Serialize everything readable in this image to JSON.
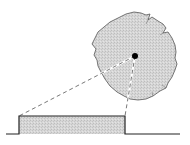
{
  "diagram": {
    "colors": {
      "background": "#ffffff",
      "fill": "#d4d4d4",
      "stroke": "#333333",
      "dot": "#000000",
      "dash": "#555555"
    },
    "blob": {
      "cx": 135,
      "cy": 58,
      "r": 42
    },
    "center_dot": {
      "x": 135,
      "y": 56,
      "r": 3
    },
    "pulse": {
      "x_start": 19,
      "x_end": 125,
      "top_y": 116,
      "baseline_y": 134,
      "baseline_x_start": 6,
      "baseline_x_end": 180
    }
  }
}
